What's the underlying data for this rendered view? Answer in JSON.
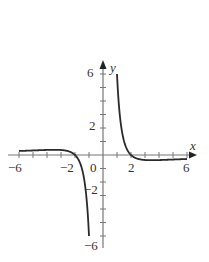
{
  "chart_data": {
    "type": "line",
    "title": "",
    "xlabel": "x",
    "ylabel": "y",
    "xlim": [
      -6,
      6
    ],
    "ylim": [
      -6,
      6
    ],
    "grid": false,
    "legend": null,
    "x_ticks": [
      -6,
      -5,
      -4,
      -3,
      -2,
      -1,
      0,
      1,
      2,
      3,
      4,
      5,
      6
    ],
    "y_ticks": [
      -6,
      -5,
      -4,
      -3,
      -2,
      -1,
      0,
      1,
      2,
      3,
      4,
      5,
      6
    ],
    "x_tick_labels": [
      "-6",
      "-2",
      "0",
      "2",
      "6"
    ],
    "y_tick_labels": [
      "6",
      "2",
      "-2",
      "-6"
    ],
    "series": [
      {
        "name": "left branch",
        "x": [
          -6,
          -5,
          -4,
          -3,
          -2.5,
          -2,
          -1.8,
          -1.6,
          -1.4,
          -1.2,
          -1.1,
          -1.0
        ],
        "y": [
          0.3,
          0.34,
          0.38,
          0.37,
          0.29,
          0.0,
          -0.39,
          -1.07,
          -2.33,
          -4.74,
          -6.0,
          -6.0
        ]
      },
      {
        "name": "right branch",
        "x": [
          1.0,
          1.1,
          1.2,
          1.4,
          1.6,
          1.8,
          2.0,
          2.5,
          3,
          4,
          5,
          6
        ],
        "y": [
          6.0,
          6.0,
          4.74,
          2.33,
          1.07,
          0.39,
          0.0,
          -0.29,
          -0.37,
          -0.38,
          -0.34,
          -0.3
        ]
      }
    ],
    "asymptotes": {
      "vertical": [
        0
      ],
      "horizontal": [
        0
      ]
    }
  },
  "labels": {
    "x_axis": "x",
    "y_axis": "y",
    "xt_m6": "−6",
    "xt_m2": "−2",
    "xt_0": "0",
    "xt_2": "2",
    "xt_6": "6",
    "yt_6": "6",
    "yt_2": "2",
    "yt_m2": "−2",
    "yt_m6": "−6"
  },
  "colors": {
    "axis": "#777777",
    "curve": "#2a2a2a"
  }
}
